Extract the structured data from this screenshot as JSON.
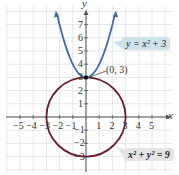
{
  "chart_data": {
    "type": "line",
    "title": "",
    "xlabel": "x",
    "ylabel": "y",
    "xlim": [
      -5.5,
      6
    ],
    "ylim": [
      -3.5,
      8
    ],
    "grid": true,
    "x_ticks": [
      "-5",
      "-4",
      "-3",
      "-2",
      "-1",
      "1",
      "2",
      "3",
      "4",
      "5"
    ],
    "y_ticks": [
      "-3",
      "-2",
      "-1",
      "1",
      "2",
      "3",
      "4",
      "5",
      "6",
      "7"
    ],
    "series": [
      {
        "name": "y = x² + 3",
        "kind": "parabola",
        "equation": "y = x^2 + 3",
        "color": "#3d6aa8",
        "vertex": [
          0,
          3
        ]
      },
      {
        "name": "x² + y² = 9",
        "kind": "circle",
        "equation": "x^2 + y^2 = 9",
        "color": "#6b1f2e",
        "center": [
          0,
          0
        ],
        "radius": 3
      }
    ],
    "annotations": [
      {
        "text": "(0, 3)",
        "point": [
          0,
          3
        ]
      }
    ]
  },
  "labels": {
    "x_axis": "x",
    "y_axis": "y",
    "point": "(0, 3)",
    "parabola_eq": "y = x² + 3",
    "circle_eq": "x² + y² = 9"
  },
  "colors": {
    "parabola": "#3d6aa8",
    "circle": "#6b1f2e",
    "grid": "#d8dde3",
    "axis": "#555555",
    "parabola_box": "#cfe3ec",
    "circle_box": "#e4e4e4"
  }
}
